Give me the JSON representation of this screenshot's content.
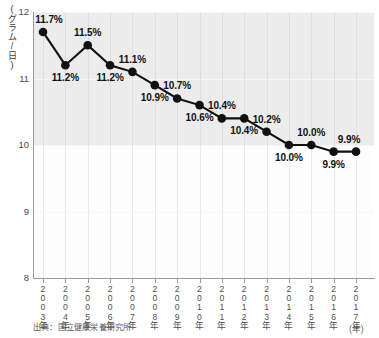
{
  "chart_data": {
    "type": "line",
    "title": "",
    "xlabel": "(年)",
    "ylabel": "(グラム/日)",
    "ylim": [
      8,
      12
    ],
    "yticks": [
      8,
      9,
      10,
      11,
      12
    ],
    "ytick_labels": [
      "8",
      "9",
      "10",
      "11",
      "12"
    ],
    "grid": true,
    "legend": null,
    "categories": [
      "2003年",
      "2004年",
      "2005年",
      "2006年",
      "2007年",
      "2008年",
      "2009年",
      "2010年",
      "2011年",
      "2012年",
      "2013年",
      "2014年",
      "2015年",
      "2016年",
      "2017年"
    ],
    "x": [
      2003,
      2004,
      2005,
      2006,
      2007,
      2008,
      2009,
      2010,
      2011,
      2012,
      2013,
      2014,
      2015,
      2016,
      2017
    ],
    "values": [
      11.7,
      11.2,
      11.5,
      11.2,
      11.1,
      10.9,
      10.7,
      10.6,
      10.4,
      10.4,
      10.2,
      10.0,
      10.0,
      9.9,
      9.9
    ],
    "data_labels": [
      "11.7%",
      "11.2%",
      "11.5%",
      "11.2%",
      "11.1%",
      "10.9%",
      "10.7%",
      "10.6%",
      "10.4%",
      "10.4%",
      "10.2%",
      "10.0%",
      "10.0%",
      "9.9%",
      "9.9%"
    ],
    "label_positions": [
      "above",
      "below",
      "above",
      "below",
      "above",
      "below",
      "above",
      "below",
      "above",
      "below",
      "above",
      "below",
      "above",
      "below",
      "above"
    ],
    "source_note": "出典：国立健康栄養研究所",
    "shaded_region": {
      "from": 10,
      "to": 12,
      "color": "#ececec"
    },
    "series_color": "#111111"
  },
  "axis": {
    "y_caption": "(グラム/日)",
    "x_unit": "(年)"
  },
  "footer": {
    "source": "出典：国立健康栄養研究所"
  }
}
